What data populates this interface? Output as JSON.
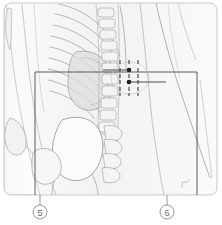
{
  "figure": {
    "background_color": "#ffffff",
    "outer_frame": {
      "stroke_color": "#c9c9c9",
      "x": 4,
      "y": 3,
      "width": 213,
      "height": 192,
      "corner_radius": 7
    },
    "inner_frame": {
      "stroke_color": "#4a4a4a",
      "x": 35,
      "y": 72,
      "width": 162,
      "height": 123
    }
  },
  "anatomy": {
    "line_color": "#9a9a9a",
    "fill_light": "#f4f4f4",
    "fill_mid": "#e6e6e6",
    "fill_shadow": "#d8d8d8",
    "regions": [
      {
        "name": "rib-cage",
        "label": "Rib cage"
      },
      {
        "name": "spine",
        "label": "Vertebral column"
      },
      {
        "name": "pelvis",
        "label": "Pelvic bone / ilium"
      },
      {
        "name": "femur-head",
        "label": "Femoral head"
      },
      {
        "name": "soft-tissue-right",
        "label": "Abdominal soft tissue"
      },
      {
        "name": "liver-shadow",
        "label": "Liver shadow"
      }
    ]
  },
  "point_cluster": {
    "name": "acupoint-cluster",
    "ellipse": {
      "cx": 130,
      "cy": 78,
      "rx": 19,
      "ry": 16,
      "stroke_color": "#cdcdcd"
    },
    "dot_color": "#1a1a1a",
    "tick_color": "#555555",
    "leader_color": "#3a3a3a",
    "major_points": [
      {
        "cx": 129,
        "cy": 70,
        "r": 2.3
      },
      {
        "cx": 129,
        "cy": 82,
        "r": 2.3
      }
    ],
    "columns_x": [
      120,
      129,
      138
    ],
    "rows_y": [
      62,
      70,
      76,
      82,
      89
    ],
    "leaders": [
      {
        "x1": 103,
        "y1": 70,
        "x2": 129,
        "y2": 70
      },
      {
        "x1": 129,
        "y1": 82,
        "x2": 163,
        "y2": 82
      }
    ]
  },
  "callouts": [
    {
      "id": "callout-5",
      "text": "5",
      "circle": {
        "cx": 40,
        "cy": 212,
        "r": 7
      },
      "leader": {
        "x1": 40,
        "y1": 195,
        "x2": 40,
        "y2": 205
      },
      "stroke_color": "#8a8a8a"
    },
    {
      "id": "callout-6",
      "text": "6",
      "circle": {
        "cx": 167,
        "cy": 212,
        "r": 7
      },
      "leader": {
        "x1": 167,
        "y1": 195,
        "x2": 167,
        "y2": 205
      },
      "stroke_color": "#8a8a8a"
    }
  ],
  "marks": [
    {
      "name": "corner-tick-mark",
      "x": 184,
      "y": 183,
      "color": "#b0b0b0"
    }
  ]
}
